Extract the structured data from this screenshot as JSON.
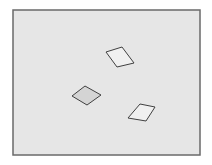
{
  "diagram": {
    "type": "shapes-in-frame",
    "background_color": "#ffffff",
    "frame": {
      "x": 13,
      "y": 10,
      "width": 187,
      "height": 145,
      "fill": "#e6e6e6",
      "stroke": "#6a6a6a",
      "stroke_width": 1.5
    },
    "shapes": [
      {
        "id": "rhombus-top",
        "kind": "rhombus",
        "points": "106,52 122,47 134,63 117,67",
        "fill": "#f0f0f0",
        "stroke": "#404040"
      },
      {
        "id": "rhombus-left",
        "kind": "rhombus",
        "points": "72,96 85,86 101,95 87,105",
        "fill": "#d4d4d4",
        "stroke": "#404040"
      },
      {
        "id": "rhombus-right",
        "kind": "rhombus",
        "points": "128,118 140,104 155,107 146,121",
        "fill": "#f0f0f0",
        "stroke": "#404040"
      }
    ]
  }
}
